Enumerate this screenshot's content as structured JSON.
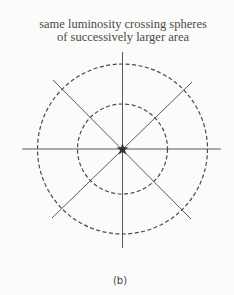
{
  "title": {
    "line1": "same luminosity crossing spheres",
    "line2": "of successively larger area"
  },
  "caption": "(b)",
  "diagram": {
    "center": [
      122.5,
      149
    ],
    "inner_circle_radius": 45,
    "outer_circle_radius": 85,
    "circle_style": "dashed",
    "rays": 8,
    "center_symbol": "star",
    "line_color": "#555555"
  }
}
